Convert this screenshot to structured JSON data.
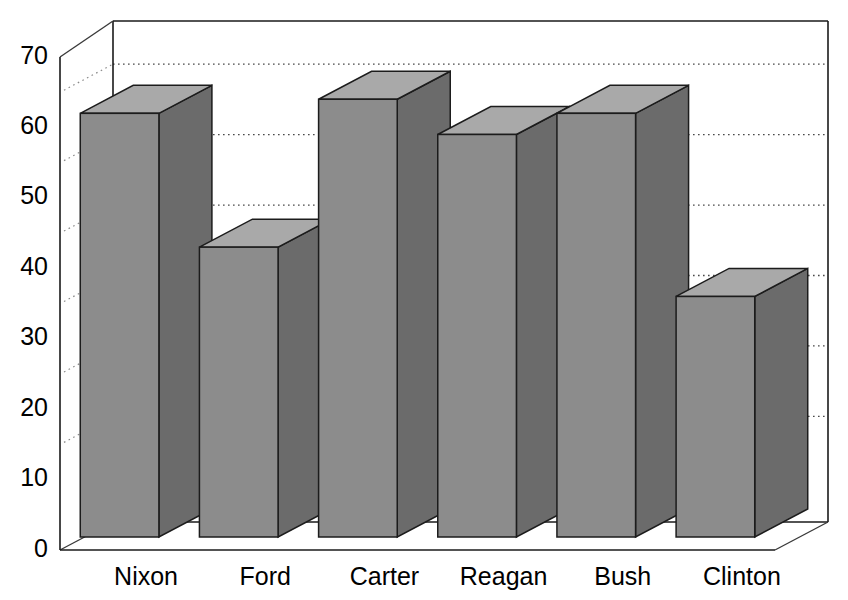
{
  "chart_data": {
    "type": "bar",
    "title": "",
    "subtitle": "",
    "xlabel": "",
    "ylabel": "",
    "categories": [
      "Nixon",
      "Ford",
      "Carter",
      "Reagan",
      "Bush",
      "Clinton"
    ],
    "values": [
      62,
      43,
      64,
      59,
      62,
      36
    ],
    "series": [
      {
        "name": "",
        "values": [
          62,
          43,
          64,
          59,
          62,
          36
        ]
      }
    ],
    "ylim": [
      0,
      70
    ],
    "ytick_labels": [
      "0",
      "10",
      "20",
      "30",
      "40",
      "50",
      "60",
      "70"
    ],
    "ytick_values": [
      0,
      10,
      20,
      30,
      40,
      50,
      60,
      70
    ],
    "gridline_values": [
      15,
      25,
      35,
      45,
      55,
      65
    ],
    "grid": true,
    "grid_style": "dotted",
    "legend": false,
    "legend_position": "none",
    "annotations": [],
    "style": "3d-bar",
    "colors": {
      "bar_front": "#8c8c8c",
      "bar_side": "#6b6b6b",
      "bar_top": "#a9a9a9",
      "bar_outline": "#1c1c1c",
      "axis": "#1a1a1a",
      "grid": "#4a4a4a",
      "background": "#ffffff",
      "text": "#000000"
    }
  },
  "axes": {
    "y_axis_name": "y-axis",
    "x_axis_name": "x-axis"
  }
}
